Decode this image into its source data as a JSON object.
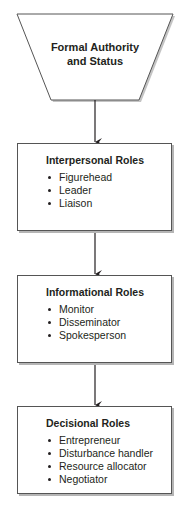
{
  "diagram": {
    "top_shape": {
      "shape": "inverted-trapezoid",
      "label_lines": [
        "Formal Authority",
        "and Status"
      ]
    },
    "boxes": [
      {
        "title": "Interpersonal Roles",
        "items": [
          "Figurehead",
          "Leader",
          "Liaison"
        ]
      },
      {
        "title": "Informational Roles",
        "items": [
          "Monitor",
          "Disseminator",
          "Spokesperson"
        ]
      },
      {
        "title": "Decisional Roles",
        "items": [
          "Entrepreneur",
          "Disturbance handler",
          "Resource allocator",
          "Negotiator"
        ]
      }
    ],
    "connectors": [
      {
        "from": "Formal Authority and Status",
        "to": "Interpersonal Roles",
        "type": "arrow"
      },
      {
        "from": "Interpersonal Roles",
        "to": "Informational Roles",
        "type": "arrow"
      },
      {
        "from": "Informational Roles",
        "to": "Decisional Roles",
        "type": "arrow"
      }
    ],
    "colors": {
      "stroke": "#231f20",
      "shadow": "#b5b5b5",
      "fill": "#ffffff"
    }
  }
}
